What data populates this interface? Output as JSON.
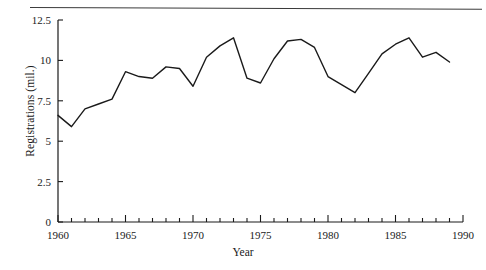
{
  "chart_data": {
    "type": "line",
    "title": "",
    "xlabel": "Year",
    "ylabel": "Registrations (mil.)",
    "xlim": [
      1960,
      1990
    ],
    "ylim": [
      0,
      12.5
    ],
    "grid": false,
    "legend": null,
    "x_ticks": [
      1960,
      1965,
      1970,
      1975,
      1980,
      1985,
      1990
    ],
    "x_tick_labels": [
      "1960",
      "1965",
      "1970",
      "1975",
      "1980",
      "1985",
      "1990"
    ],
    "x_minor_tick_interval": 1,
    "y_ticks": [
      0,
      2.5,
      5,
      7.5,
      10,
      12.5
    ],
    "y_tick_labels": [
      "0",
      "2.5",
      "5",
      "7.5",
      "10",
      "12.5"
    ],
    "line_color": "#1a1a1a",
    "line_width": 1.4,
    "x": [
      1960,
      1961,
      1962,
      1963,
      1964,
      1965,
      1966,
      1967,
      1968,
      1969,
      1970,
      1971,
      1972,
      1973,
      1974,
      1975,
      1976,
      1977,
      1978,
      1979,
      1980,
      1981,
      1982,
      1983,
      1984,
      1985,
      1986,
      1987,
      1988,
      1989
    ],
    "values": [
      6.6,
      5.9,
      7.0,
      7.3,
      7.6,
      9.3,
      9.0,
      8.9,
      9.6,
      9.5,
      8.4,
      10.2,
      10.9,
      11.4,
      8.9,
      8.6,
      10.1,
      11.2,
      11.3,
      10.8,
      9.0,
      8.5,
      8.0,
      9.2,
      10.4,
      11.0,
      11.4,
      10.2,
      10.5,
      9.9
    ],
    "series_name": "Registrations"
  }
}
